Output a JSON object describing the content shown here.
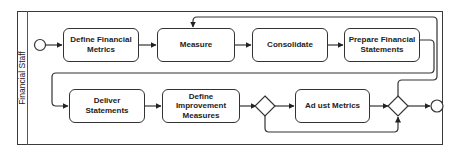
{
  "diagram": {
    "type": "BPMN process",
    "lane": {
      "label": "Financial Staff"
    },
    "tasks": [
      {
        "id": "t1",
        "label": "Define Financial Metrics"
      },
      {
        "id": "t2",
        "label": "Measure"
      },
      {
        "id": "t3",
        "label": "Consolidate"
      },
      {
        "id": "t4",
        "label": "Prepare Financial Statements"
      },
      {
        "id": "t5",
        "label": "Deliver Statements"
      },
      {
        "id": "t6",
        "label": "Define Improvement Measures"
      },
      {
        "id": "t7",
        "label": "Ad ust Metrics"
      }
    ],
    "gateways": [
      {
        "id": "g1",
        "type": "exclusive"
      },
      {
        "id": "g2",
        "type": "exclusive"
      }
    ],
    "events": [
      {
        "id": "start",
        "type": "start"
      },
      {
        "id": "end",
        "type": "end"
      }
    ],
    "flows": [
      [
        "start",
        "t1"
      ],
      [
        "t1",
        "t2"
      ],
      [
        "t2",
        "t3"
      ],
      [
        "t3",
        "t4"
      ],
      [
        "t4",
        "t5"
      ],
      [
        "t5",
        "t6"
      ],
      [
        "t6",
        "g1"
      ],
      [
        "g1",
        "t7"
      ],
      [
        "g1",
        "g2"
      ],
      [
        "t7",
        "g2"
      ],
      [
        "g2",
        "end"
      ],
      [
        "g2",
        "t2"
      ]
    ],
    "colors": {
      "stroke": "#333333",
      "background": "#ffffff"
    }
  }
}
